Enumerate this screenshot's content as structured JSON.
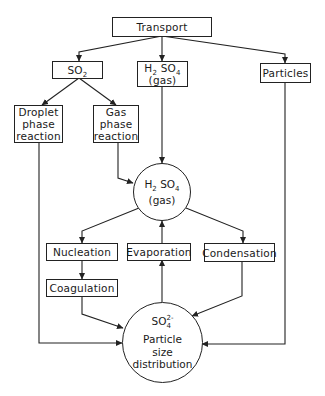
{
  "diagram": {
    "nodes": {
      "transport": {
        "label": "Transport"
      },
      "so2": {
        "label": "SO",
        "sub": "2"
      },
      "h2so4_gas_box": {
        "line1_pre": "H",
        "line1_sub1": "2",
        "line1_mid": " SO",
        "line1_sub2": "4",
        "line2": "(gas)"
      },
      "particles": {
        "label": "Particles"
      },
      "droplet": {
        "line1": "Droplet",
        "line2": "phase",
        "line3": "reaction"
      },
      "gas_phase": {
        "line1": "Gas",
        "line2": "phase",
        "line3": "reaction"
      },
      "h2so4_circle": {
        "line1_pre": "H",
        "line1_sub1": "2",
        "line1_mid": " SO",
        "line1_sub2": "4",
        "line2": "(gas)"
      },
      "nucleation": {
        "label": "Nucleation"
      },
      "evaporation": {
        "label": "Evaporation"
      },
      "condensation": {
        "label": "Condensation"
      },
      "coagulation": {
        "label": "Coagulation"
      },
      "so4_circle": {
        "chem": "SO",
        "sub": "4",
        "sup": "2-",
        "line2": "Particle",
        "line3": "size",
        "line4": "distribution"
      }
    },
    "edges": [
      {
        "from": "Transport",
        "to": "SO2"
      },
      {
        "from": "Transport",
        "to": "H2SO4 (gas) box"
      },
      {
        "from": "Transport",
        "to": "Particles"
      },
      {
        "from": "SO2",
        "to": "Droplet phase reaction"
      },
      {
        "from": "SO2",
        "to": "Gas phase reaction"
      },
      {
        "from": "H2SO4 (gas) box",
        "to": "H2SO4 (gas) circle"
      },
      {
        "from": "Gas phase reaction",
        "to": "H2SO4 (gas) circle"
      },
      {
        "from": "H2SO4 (gas) circle",
        "to": "Nucleation"
      },
      {
        "from": "H2SO4 (gas) circle",
        "to": "Condensation"
      },
      {
        "from": "Evaporation",
        "to": "H2SO4 (gas) circle"
      },
      {
        "from": "Nucleation",
        "to": "Coagulation"
      },
      {
        "from": "Coagulation",
        "to": "SO4 2- Particle size distribution"
      },
      {
        "from": "Condensation",
        "to": "SO4 2- Particle size distribution"
      },
      {
        "from": "SO4 2- Particle size distribution",
        "to": "Evaporation"
      },
      {
        "from": "Droplet phase reaction",
        "to": "SO4 2- Particle size distribution"
      },
      {
        "from": "Particles",
        "to": "SO4 2- Particle size distribution"
      }
    ],
    "colors": {
      "line": "#222222",
      "background": "#ffffff"
    }
  }
}
